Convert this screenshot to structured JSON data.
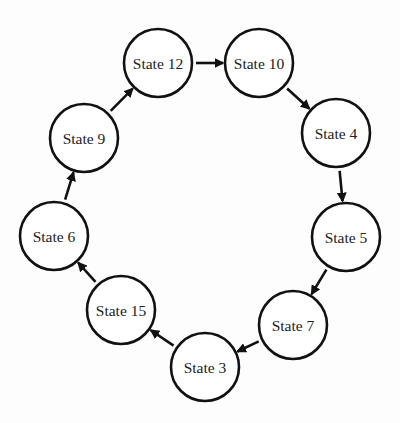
{
  "diagram": {
    "type": "state-cycle",
    "nodes": [
      {
        "id": "s12",
        "label": "State 12",
        "cx": 158,
        "cy": 63
      },
      {
        "id": "s10",
        "label": "State 10",
        "cx": 259,
        "cy": 63
      },
      {
        "id": "s4",
        "label": "State 4",
        "cx": 336,
        "cy": 133
      },
      {
        "id": "s5",
        "label": "State 5",
        "cx": 346,
        "cy": 237
      },
      {
        "id": "s7",
        "label": "State 7",
        "cx": 293,
        "cy": 325
      },
      {
        "id": "s3",
        "label": "State 3",
        "cx": 205,
        "cy": 367
      },
      {
        "id": "s15",
        "label": "State 15",
        "cx": 121,
        "cy": 310
      },
      {
        "id": "s6",
        "label": "State 6",
        "cx": 54,
        "cy": 236
      },
      {
        "id": "s9",
        "label": "State 9",
        "cx": 84,
        "cy": 138
      }
    ],
    "edges": [
      {
        "from": "s12",
        "to": "s10"
      },
      {
        "from": "s10",
        "to": "s4"
      },
      {
        "from": "s4",
        "to": "s5"
      },
      {
        "from": "s5",
        "to": "s7"
      },
      {
        "from": "s7",
        "to": "s3"
      },
      {
        "from": "s3",
        "to": "s15"
      },
      {
        "from": "s15",
        "to": "s6"
      },
      {
        "from": "s6",
        "to": "s9"
      },
      {
        "from": "s9",
        "to": "s12"
      }
    ],
    "radius": 34
  }
}
